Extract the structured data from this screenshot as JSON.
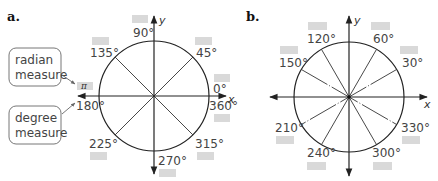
{
  "panel_a": {
    "label": "a.",
    "x_axis_label": "x",
    "y_axis_label": "y",
    "angles": [
      {
        "deg": "0°",
        "angle": 0
      },
      {
        "deg": "45°",
        "angle": 45
      },
      {
        "deg": "90°",
        "angle": 90
      },
      {
        "deg": "135°",
        "angle": 135
      },
      {
        "deg": "180°",
        "angle": 180
      },
      {
        "deg": "225°",
        "angle": 225
      },
      {
        "deg": "270°",
        "angle": 270
      },
      {
        "deg": "315°",
        "angle": 315
      },
      {
        "deg": "360°",
        "angle": 360
      }
    ],
    "callouts": {
      "radian": [
        "radian",
        "measure"
      ],
      "degree": [
        "degree",
        "measure"
      ]
    },
    "radian_example": "π"
  },
  "panel_b": {
    "label": "b.",
    "x_axis_label": "x",
    "y_axis_label": "y",
    "angles": [
      {
        "deg": "30°",
        "angle": 30
      },
      {
        "deg": "60°",
        "angle": 60
      },
      {
        "deg": "120°",
        "angle": 120
      },
      {
        "deg": "150°",
        "angle": 150
      },
      {
        "deg": "210°",
        "angle": 210
      },
      {
        "deg": "240°",
        "angle": 240
      },
      {
        "deg": "300°",
        "angle": 300
      },
      {
        "deg": "330°",
        "angle": 330
      }
    ]
  },
  "colors": {
    "answer_box": "#d9d9d9",
    "line": "#222222",
    "text": "#444444"
  }
}
